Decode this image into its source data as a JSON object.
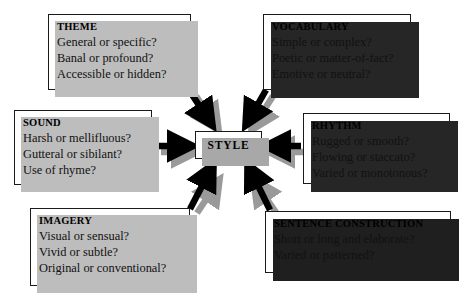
{
  "diagram": {
    "title": "STYLE",
    "center": {
      "label": "STYLE",
      "name": "style"
    },
    "nodes": [
      {
        "id": "theme",
        "title": "THEME",
        "lines": [
          "General or specific?",
          "Banal or profound?",
          "Accessible or hidden?"
        ]
      },
      {
        "id": "vocabulary",
        "title": "VOCABULARY",
        "lines": [
          "Simple or complex?",
          "Poetic or matter-of-fact?",
          "Emotive or neutral?"
        ]
      },
      {
        "id": "sound",
        "title": "SOUND",
        "lines": [
          "Harsh or mellifluous?",
          "Gutteral or sibilant?",
          "Use of rhyme?"
        ]
      },
      {
        "id": "rhythm",
        "title": "RHYTHM",
        "lines": [
          "Rugged or smooth?",
          "Flowing or staccato?",
          "Varied or monotonous?"
        ]
      },
      {
        "id": "imagery",
        "title": "IMAGERY",
        "lines": [
          "Visual or sensual?",
          "Vivid or subtle?",
          "Original or conventional?"
        ]
      },
      {
        "id": "sentence",
        "title": "SENTENCE CONSTRUCTION",
        "lines": [
          "Short or long and elaborate?",
          "Varied or patterned?"
        ]
      }
    ],
    "connections": [
      {
        "from": "theme",
        "to": "style",
        "direction": "down-right"
      },
      {
        "from": "vocabulary",
        "to": "style",
        "direction": "down-left"
      },
      {
        "from": "sound",
        "to": "style",
        "direction": "right"
      },
      {
        "from": "rhythm",
        "to": "style",
        "direction": "left"
      },
      {
        "from": "imagery",
        "to": "style",
        "direction": "up-right"
      },
      {
        "from": "sentence",
        "to": "style",
        "direction": "up-left"
      }
    ],
    "colors": {
      "arrow": "#000000",
      "arrow_shadow": "#9a9a9a",
      "box_border": "#1a1a1a",
      "box_fill": "#ffffff",
      "shadow_light": "#bdbdbd",
      "shadow_dark": "#262626",
      "text": "#000000",
      "background": "#ffffff"
    }
  }
}
